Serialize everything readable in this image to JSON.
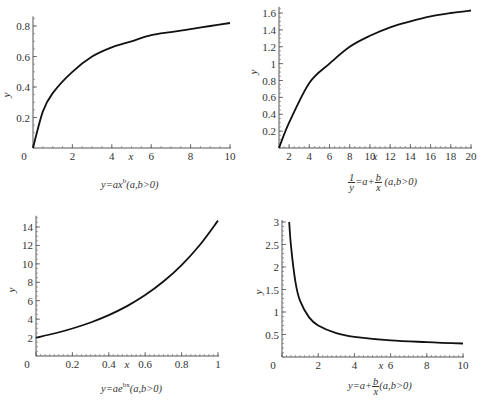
{
  "chart_data": [
    {
      "type": "line",
      "title": "",
      "caption": "y=ax^b (a,b>0)",
      "xlabel": "x",
      "ylabel": "y",
      "xlim": [
        0,
        10
      ],
      "ylim": [
        0,
        0.85
      ],
      "xticks": [
        "0",
        "2",
        "4",
        "6",
        "8",
        "10"
      ],
      "yticks": [
        "0.2",
        "0.4",
        "0.6",
        "0.8"
      ],
      "grid": false,
      "series": [
        {
          "name": "y=ax^b",
          "x": [
            0,
            0.5,
            1,
            2,
            3,
            4,
            5,
            6,
            7,
            8,
            9,
            10
          ],
          "values": [
            0,
            0.24,
            0.36,
            0.5,
            0.6,
            0.66,
            0.7,
            0.74,
            0.76,
            0.78,
            0.8,
            0.82
          ]
        }
      ]
    },
    {
      "type": "line",
      "title": "",
      "caption": "1/y = a + b/x (a,b>0)",
      "xlabel": "x",
      "ylabel": "y",
      "xlim": [
        1,
        20
      ],
      "ylim": [
        0,
        1.65
      ],
      "xticks": [
        "2",
        "4",
        "6",
        "8",
        "10",
        "12",
        "14",
        "16",
        "18",
        "20"
      ],
      "yticks": [
        "0.2",
        "0.4",
        "0.6",
        "0.8",
        "1",
        "1.2",
        "1.4",
        "1.6"
      ],
      "grid": false,
      "series": [
        {
          "name": "1/y=a+b/x",
          "x": [
            1,
            2,
            4,
            6,
            8,
            10,
            12,
            14,
            16,
            18,
            20
          ],
          "values": [
            0,
            0.3,
            0.77,
            1.0,
            1.2,
            1.33,
            1.43,
            1.5,
            1.56,
            1.6,
            1.63
          ]
        }
      ]
    },
    {
      "type": "line",
      "title": "",
      "caption": "y=ae^(bx) (a,b>0)",
      "xlabel": "x",
      "ylabel": "y",
      "xlim": [
        0,
        1
      ],
      "ylim": [
        0,
        15
      ],
      "xticks": [
        "0",
        "0.2",
        "0.4",
        "0.6",
        "0.8",
        "1"
      ],
      "yticks": [
        "2",
        "4",
        "6",
        "8",
        "10",
        "12",
        "14"
      ],
      "grid": false,
      "series": [
        {
          "name": "y=ae^(bx)",
          "x": [
            0,
            0.1,
            0.2,
            0.3,
            0.4,
            0.5,
            0.6,
            0.7,
            0.8,
            0.9,
            1.0
          ],
          "values": [
            2,
            2.44,
            2.98,
            3.64,
            4.44,
            5.42,
            6.62,
            8.08,
            9.87,
            12.05,
            14.7
          ]
        }
      ]
    },
    {
      "type": "line",
      "title": "",
      "caption": "y=a + b/x (a,b>0)",
      "xlabel": "x",
      "ylabel": "y",
      "xlim": [
        0,
        10
      ],
      "ylim": [
        0,
        3
      ],
      "xticks": [
        "0",
        "2",
        "4",
        "6",
        "8",
        "10"
      ],
      "yticks": [
        "0.5",
        "1",
        "1.5",
        "2",
        "2.5",
        "3"
      ],
      "grid": false,
      "series": [
        {
          "name": "y=a+b/x",
          "x": [
            0.4,
            0.5,
            0.75,
            1,
            1.5,
            2,
            3,
            4,
            6,
            8,
            10
          ],
          "values": [
            3.0,
            2.45,
            1.65,
            1.25,
            0.88,
            0.7,
            0.53,
            0.45,
            0.37,
            0.33,
            0.3
          ]
        }
      ]
    }
  ],
  "captions": {
    "c1": {
      "pre": "y=ax",
      "sup": "b",
      "post": "(a,b>0)"
    },
    "c2": {
      "num1": "1",
      "den1": "y",
      "mid": "=a+",
      "num2": "b",
      "den2": "x",
      "post": " (a,b>0)"
    },
    "c3": {
      "pre": "y=ae",
      "sup": "bx",
      "post": "(a,b>0)"
    },
    "c4": {
      "pre": "y=a+",
      "num": "b",
      "den": "x",
      "post": "(a,b>0)"
    }
  }
}
